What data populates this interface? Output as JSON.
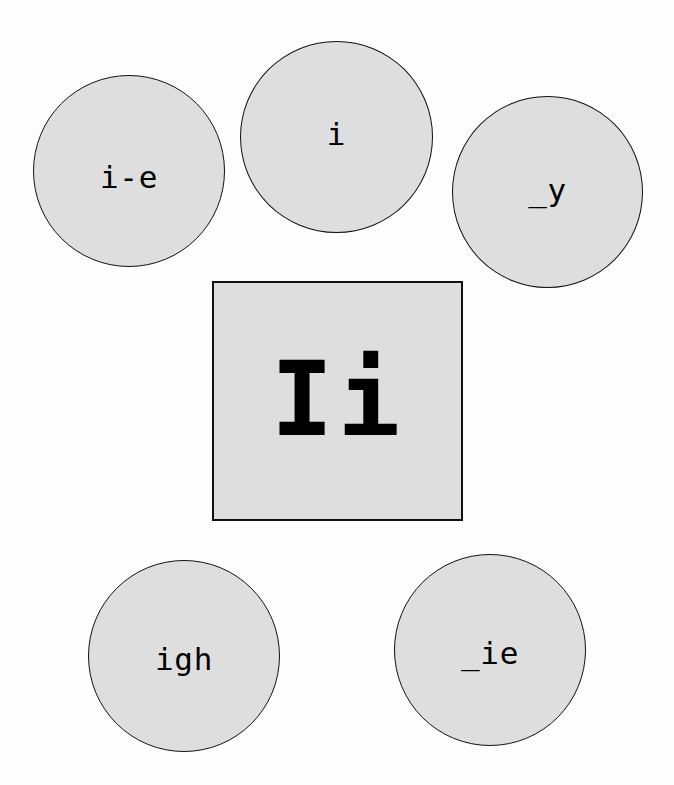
{
  "board": {
    "background_color": "#fdfdfd",
    "shape_fill_color": "#dedede",
    "shape_border_color": "#111111",
    "text_color": "#000000"
  },
  "center": {
    "id": "main-grapheme",
    "shape": "square",
    "label": "Ii"
  },
  "graphemes": [
    {
      "id": "i-e",
      "shape": "circle",
      "label": "i-e",
      "position": "top-left"
    },
    {
      "id": "i",
      "shape": "circle",
      "label": "i",
      "position": "top-center"
    },
    {
      "id": "_y",
      "shape": "circle",
      "label": "_y",
      "position": "top-right"
    },
    {
      "id": "igh",
      "shape": "circle",
      "label": "igh",
      "position": "bottom-left"
    },
    {
      "id": "_ie",
      "shape": "circle",
      "label": "_ie",
      "position": "bottom-right"
    }
  ]
}
